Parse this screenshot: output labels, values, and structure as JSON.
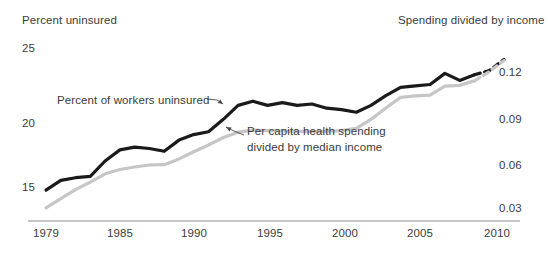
{
  "axis": {
    "left_title": "Percent uninsured",
    "right_title": "Spending divided by income",
    "left_ticks": [
      "25",
      "20",
      "15"
    ],
    "right_ticks": [
      "0.12",
      "0.09",
      "0.06",
      "0.03"
    ],
    "x_ticks": [
      "1979",
      "1985",
      "1990",
      "1995",
      "2000",
      "2005",
      "2010"
    ]
  },
  "annotations": {
    "black_series": "Percent of workers uninsured",
    "gray_series_line1": "Per capita health spending",
    "gray_series_line2": "divided by median income"
  },
  "colors": {
    "black_series": "#1a1a1a",
    "gray_series": "#c6c6c6",
    "axis": "#8c8c8c",
    "text": "#3b3b3b",
    "background": "#ffffff"
  },
  "chart_data": {
    "type": "line",
    "title": "",
    "subtitle": "",
    "xlabel": "",
    "ylabel": "Percent uninsured",
    "y2label": "Spending divided by income",
    "xlim": [
      1979,
      2010
    ],
    "ylim": [
      12.2,
      26.8
    ],
    "y2lim": [
      0.0163,
      0.1416
    ],
    "grid": false,
    "legend": "annotations on plot",
    "x": [
      1979,
      1980,
      1981,
      1982,
      1983,
      1984,
      1985,
      1986,
      1987,
      1988,
      1989,
      1990,
      1991,
      1992,
      1993,
      1994,
      1995,
      1996,
      1997,
      1998,
      1999,
      2000,
      2001,
      2002,
      2003,
      2004,
      2005,
      2006,
      2007,
      2008,
      2009,
      2010
    ],
    "series": [
      {
        "name": "Percent of workers uninsured",
        "axis": "left",
        "color": "#1a1a1a",
        "style": "solid",
        "units": "percent",
        "dashed_from": 2008,
        "values": [
          14.7,
          15.4,
          15.6,
          15.7,
          16.8,
          17.6,
          17.8,
          17.7,
          17.5,
          18.3,
          18.7,
          18.9,
          19.8,
          20.8,
          21.1,
          20.8,
          21.0,
          20.8,
          20.9,
          20.6,
          20.5,
          20.3,
          20.8,
          21.5,
          22.1,
          22.2,
          22.3,
          23.1,
          22.6,
          23.0,
          23.3,
          24.1
        ]
      },
      {
        "name": "Per capita health spending divided by median income",
        "axis": "right",
        "color": "#c6c6c6",
        "style": "solid",
        "units": "ratio",
        "dashed_from": 2008,
        "values": [
          0.0295,
          0.0355,
          0.0415,
          0.0465,
          0.052,
          0.0548,
          0.0565,
          0.0578,
          0.058,
          0.0618,
          0.0665,
          0.071,
          0.076,
          0.0795,
          0.0808,
          0.0805,
          0.0803,
          0.08,
          0.0798,
          0.08,
          0.0805,
          0.082,
          0.088,
          0.0955,
          0.1025,
          0.1035,
          0.104,
          0.11,
          0.1105,
          0.1135,
          0.1195,
          0.127
        ]
      }
    ]
  }
}
